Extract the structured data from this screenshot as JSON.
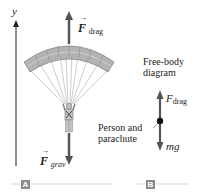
{
  "figure": {
    "panels": [
      {
        "tag": "A",
        "axis_label": "y",
        "forces": [
          {
            "symbol": "F",
            "subscript": "drag",
            "direction": "up"
          },
          {
            "symbol": "F",
            "subscript": "grav",
            "direction": "down"
          }
        ]
      },
      {
        "tag": "B",
        "title_line1": "Free-body",
        "title_line2": "diagram",
        "object_label_line1": "Person and",
        "object_label_line2": "parachute",
        "forces": [
          {
            "symbol": "F",
            "subscript": "drag",
            "direction": "up"
          },
          {
            "label": "mg",
            "direction": "down"
          }
        ]
      }
    ]
  },
  "colors": {
    "arrow": "#555555",
    "canopy": "#a8a8a8",
    "tag_bg": "#8a8a8a",
    "rule": "#cccccc"
  }
}
